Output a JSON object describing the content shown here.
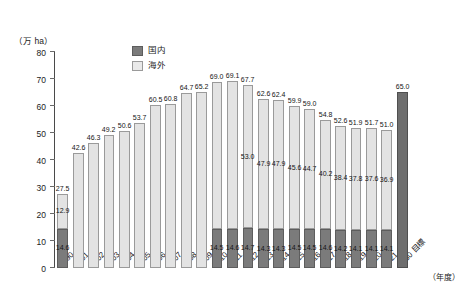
{
  "chart_data": {
    "type": "bar",
    "title": "",
    "xlabel": "",
    "ylabel": "万 ha",
    "ylim": [
      0,
      80
    ],
    "y_inverted": true,
    "grid": false,
    "legend_position": "bottom-right",
    "unit_label": "（万 ha）",
    "axis_note": "（年度）",
    "yticks": [
      "0",
      "10",
      "20",
      "30",
      "40",
      "50",
      "60",
      "70",
      "80"
    ],
    "ytick_values": [
      0,
      10,
      20,
      30,
      40,
      50,
      60,
      70,
      80
    ],
    "categories": [
      "2030 目標",
      "2021",
      "2020",
      "2019",
      "2018",
      "2017",
      "2016",
      "2015",
      "2014",
      "2013",
      "2012",
      "2011",
      "2010",
      "2009",
      "2008",
      "2007",
      "2006",
      "2005",
      "2004",
      "2003",
      "2002",
      "2001",
      "1990"
    ],
    "series": [
      {
        "name": "国内",
        "color": "#7b7b7b",
        "values": [
          null,
          14.1,
          14.1,
          14.1,
          14.2,
          14.6,
          14.5,
          14.5,
          14.3,
          14.3,
          14.7,
          14.6,
          14.5,
          null,
          null,
          null,
          null,
          null,
          null,
          null,
          null,
          null,
          14.6
        ]
      },
      {
        "name": "海外",
        "color": "#e3e3e3",
        "values": [
          null,
          36.9,
          37.6,
          37.8,
          38.4,
          40.2,
          44.7,
          45.6,
          47.9,
          47.9,
          53.0,
          null,
          null,
          null,
          null,
          null,
          null,
          null,
          null,
          null,
          null,
          null,
          12.9
        ]
      }
    ],
    "totals": [
      65.0,
      51.0,
      51.7,
      51.9,
      52.6,
      54.8,
      59.0,
      59.9,
      62.4,
      62.6,
      67.7,
      69.1,
      69.0,
      65.2,
      64.7,
      60.8,
      60.5,
      53.7,
      50.6,
      49.2,
      46.3,
      42.6,
      27.5
    ],
    "goal_color": "#6e6e6e",
    "goal_index": 0,
    "legend": [
      {
        "label": "国内",
        "swatch": "dark"
      },
      {
        "label": "海外",
        "swatch": "light"
      }
    ]
  },
  "caption": ""
}
